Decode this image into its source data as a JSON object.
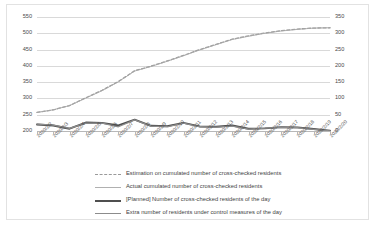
{
  "chart_data": {
    "type": "line",
    "title": "",
    "xlabel": "",
    "ylabel": "",
    "grid": true,
    "legend_position": "bottom",
    "categories": [
      "2020/2/2",
      "2020/2/3",
      "2020/2/4",
      "2020/2/5",
      "2020/2/6",
      "2020/2/7",
      "2020/2/8",
      "2020/2/9",
      "2020/2/10",
      "2020/2/11",
      "2020/2/12",
      "2020/2/13",
      "2020/2/14",
      "2020/2/15",
      "2020/2/16",
      "2020/2/17",
      "2020/2/18",
      "2020/2/19",
      "2020/2/20"
    ],
    "axes": {
      "left": {
        "ticks": [
          200,
          250,
          300,
          350,
          400,
          450,
          500,
          550
        ],
        "min": 200,
        "max": 550
      },
      "right": {
        "ticks": [
          0,
          50,
          100,
          150,
          200,
          250,
          300,
          350
        ],
        "min": 0,
        "max": 350
      }
    },
    "series": [
      {
        "name": "Estimation on cumulated number of cross-checked residents",
        "axis": "left",
        "style": "dashed",
        "color": "#9a9a9a",
        "values": [
          257,
          265,
          278,
          302,
          325,
          352,
          385,
          399,
          415,
          432,
          450,
          466,
          482,
          492,
          501,
          508,
          513,
          516,
          517
        ]
      },
      {
        "name": "Actual cumulated number of cross-checked residents",
        "axis": "left",
        "style": "solid-thin",
        "color": "#a8a8a8",
        "values": [
          257,
          265,
          278,
          301,
          324,
          351,
          384,
          398,
          414,
          431,
          449,
          465,
          481,
          491,
          500,
          507,
          512,
          516,
          517
        ]
      },
      {
        "name": "[Planned] Number of cross-checked residents of the day",
        "axis": "right",
        "style": "solid-thick",
        "color": "#4f4f4f",
        "values": [
          20,
          17,
          7,
          26,
          25,
          17,
          35,
          16,
          15,
          25,
          14,
          13,
          17,
          7,
          8,
          12,
          11,
          6,
          1
        ]
      },
      {
        "name": "Extra number of residents under control measures of the day",
        "axis": "right",
        "style": "solid-med",
        "color": "#8c8c8c",
        "values": [
          21,
          18,
          8,
          24,
          24,
          13,
          34,
          15,
          13,
          24,
          13,
          12,
          15,
          6,
          9,
          11,
          10,
          5,
          0
        ]
      }
    ]
  },
  "legend": {
    "items": [
      {
        "label": "Estimation on cumulated number of cross-checked residents"
      },
      {
        "label": "Actual cumulated number of cross-checked residents"
      },
      {
        "label": "[Planned] Number of cross-checked residents of the day"
      },
      {
        "label": "Extra number of residents under control measures of the day"
      }
    ]
  }
}
